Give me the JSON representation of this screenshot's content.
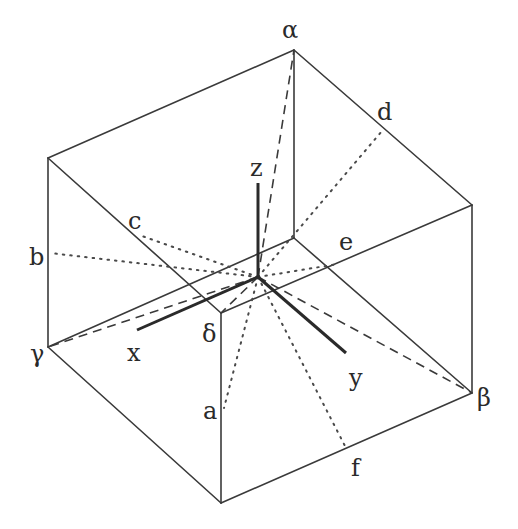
{
  "figure": {
    "colors": {
      "line": "#3a3a3a",
      "background": "#ffffff"
    },
    "labels": {
      "alpha": "α",
      "beta": "β",
      "gamma": "γ",
      "delta": "δ",
      "x_axis": "x",
      "y_axis": "y",
      "z_axis": "z",
      "a": "a",
      "b": "b",
      "c": "c",
      "d": "d",
      "e": "e",
      "f": "f"
    },
    "line_styles": {
      "cube_edges": "solid",
      "axes": "bold solid",
      "vertex_diagonals": "dashed",
      "face_point_lines": "dotted"
    }
  }
}
